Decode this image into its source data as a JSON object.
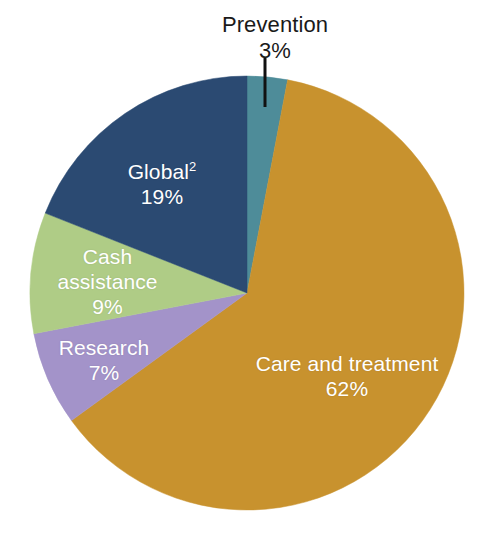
{
  "chart_data": {
    "type": "pie",
    "title": "",
    "subtitle": "",
    "xlabel": "",
    "ylabel": "",
    "legend_position": "none",
    "grid": false,
    "total": 100,
    "unit": "%",
    "start_angle_deg": 0,
    "direction": "clockwise",
    "center": {
      "x": 247,
      "y": 293
    },
    "radius": 217,
    "background_color": "#ffffff",
    "categories": [
      "Prevention",
      "Care and treatment",
      "Research",
      "Cash assistance",
      "Global"
    ],
    "values": [
      3,
      62,
      7,
      9,
      19
    ],
    "slices": [
      {
        "id": "prevention",
        "label": "Prevention",
        "footnote_marker": "",
        "value": 3,
        "value_text": "3%",
        "color": "#4e8c99",
        "label_style": "callout",
        "label_color": "#1a1a1a",
        "start_deg": 0,
        "end_deg": 10.8,
        "leader_line": {
          "x1": 265,
          "y1": 58,
          "x2": 265,
          "y2": 107
        }
      },
      {
        "id": "care-and-treatment",
        "label": "Care and treatment",
        "footnote_marker": "",
        "value": 62,
        "value_text": "62%",
        "color": "#c8922e",
        "label_style": "inside",
        "label_color": "#ffffff",
        "start_deg": 10.8,
        "end_deg": 234.0
      },
      {
        "id": "research",
        "label": "Research",
        "footnote_marker": "",
        "value": 7,
        "value_text": "7%",
        "color": "#a393c9",
        "label_style": "inside",
        "label_color": "#ffffff",
        "start_deg": 234.0,
        "end_deg": 259.2
      },
      {
        "id": "cash-assistance",
        "label": "Cash assistance",
        "label_line_1": "Cash",
        "label_line_2": "assistance",
        "footnote_marker": "",
        "value": 9,
        "value_text": "9%",
        "color": "#afcc86",
        "label_style": "inside",
        "label_color": "#ffffff",
        "start_deg": 259.2,
        "end_deg": 291.6
      },
      {
        "id": "global",
        "label": "Global",
        "footnote_marker": "2",
        "value": 19,
        "value_text": "19%",
        "color": "#2b4a72",
        "label_style": "inside",
        "label_color": "#ffffff",
        "start_deg": 291.6,
        "end_deg": 360.0
      }
    ]
  },
  "labels": {
    "prevention": {
      "name": "Prevention",
      "value": "3%"
    },
    "care": {
      "name": "Care and treatment",
      "value": "62%"
    },
    "global": {
      "name": "Global",
      "marker": "2",
      "value": "19%"
    },
    "cash": {
      "line1": "Cash",
      "line2": "assistance",
      "value": "9%"
    },
    "research": {
      "name": "Research",
      "value": "7%"
    }
  }
}
